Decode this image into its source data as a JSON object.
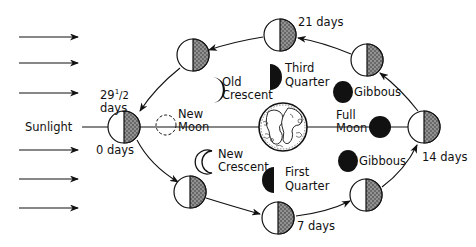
{
  "diagram": {
    "type": "lunar-phases-orbit",
    "colors": {
      "ink": "#111111",
      "stipple": "#555555",
      "background": "#ffffff"
    },
    "sunlight": {
      "label": "Sunlight",
      "arrow_count": 6
    },
    "earth": {
      "label": ""
    },
    "orbit_markers": [
      {
        "label_main": "0 days",
        "position": "left"
      },
      {
        "label_main": "29",
        "label_sup": "1",
        "label_frac": "/2",
        "label_line2": "days",
        "position": "left"
      },
      {
        "label_main": "7 days",
        "position": "bottom"
      },
      {
        "label_main": "14 days",
        "position": "right"
      },
      {
        "label_main": "21 days",
        "position": "top"
      }
    ],
    "phases": [
      {
        "name": "New Moon",
        "line1": "New",
        "line2": "Moon",
        "appearance": "dashed-outline"
      },
      {
        "name": "New Crescent",
        "line1": "New",
        "line2": "Crescent",
        "appearance": "thin-crescent-outline"
      },
      {
        "name": "First Quarter",
        "line1": "First",
        "line2": "Quarter",
        "appearance": "left-half-dark"
      },
      {
        "name": "Gibbous (waxing)",
        "line1": "Gibbous",
        "appearance": "mostly-dark"
      },
      {
        "name": "Full Moon",
        "line1": "Full",
        "line2": "Moon",
        "appearance": "full-dark"
      },
      {
        "name": "Gibbous (waning)",
        "line1": "Gibbous",
        "appearance": "mostly-dark"
      },
      {
        "name": "Third Quarter",
        "line1": "Third",
        "line2": "Quarter",
        "appearance": "right-half-dark"
      },
      {
        "name": "Old Crescent",
        "line1": "Old",
        "line2": "Crescent",
        "appearance": "thick-crescent"
      }
    ]
  }
}
